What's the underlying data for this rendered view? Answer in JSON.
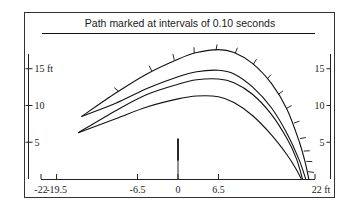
{
  "chart_data": {
    "type": "line",
    "title": "Path marked at intervals of 0.10 seconds",
    "xlabel": "",
    "ylabel": "",
    "x_unit": "ft",
    "y_unit": "ft",
    "xlim": [
      -22,
      22
    ],
    "ylim": [
      0,
      19
    ],
    "x_ticks": [
      -22,
      -19.5,
      -6.5,
      0,
      6.5,
      22
    ],
    "x_tick_labels": [
      "-22",
      "-19.5",
      "-6.5",
      "0",
      "6.5",
      "22 ft"
    ],
    "y_ticks": [
      5,
      10,
      15
    ],
    "y_tick_labels_left": [
      "5",
      "10",
      "15 ft"
    ],
    "y_tick_labels_right": [
      "5",
      "10",
      "15"
    ],
    "grid": false,
    "legend": null,
    "annotations": [
      {
        "type": "vertical-marker",
        "x": 0,
        "y_from": 0,
        "y_to": 5.5,
        "thick_from": 2.5
      }
    ],
    "series": [
      {
        "name": "path-1 (marked every 0.10 s)",
        "points": [
          [
            -15.5,
            8.5
          ],
          [
            -10,
            11.7
          ],
          [
            -5,
            14.3
          ],
          [
            0,
            16.3
          ],
          [
            3,
            17.2
          ],
          [
            6.5,
            17.6
          ],
          [
            9,
            17.2
          ],
          [
            12,
            15.7
          ],
          [
            15,
            13
          ],
          [
            17.5,
            9.5
          ],
          [
            19.5,
            5
          ],
          [
            20.5,
            2
          ],
          [
            21,
            0
          ]
        ],
        "time_marks": [
          [
            -9.5,
            11.9
          ],
          [
            -4.2,
            14.7
          ],
          [
            -0.6,
            16.2
          ],
          [
            2.6,
            17.1
          ],
          [
            6.1,
            17.5
          ],
          [
            9.2,
            17.1
          ],
          [
            12.1,
            15.6
          ],
          [
            14.3,
            13.6
          ],
          [
            16.1,
            11.5
          ],
          [
            17.4,
            9.6
          ],
          [
            18.6,
            7.6
          ],
          [
            19.6,
            5.5
          ],
          [
            20.2,
            3.8
          ],
          [
            20.6,
            2.4
          ],
          [
            20.9,
            1
          ]
        ]
      },
      {
        "name": "path-2",
        "points": [
          [
            -15.5,
            8.5
          ],
          [
            -10,
            10.3
          ],
          [
            -5,
            12.3
          ],
          [
            0,
            13.9
          ],
          [
            3,
            14.6
          ],
          [
            6.5,
            14.8
          ],
          [
            9,
            14.3
          ],
          [
            12,
            12.5
          ],
          [
            15,
            9.7
          ],
          [
            17.5,
            6.2
          ],
          [
            19.5,
            2.5
          ],
          [
            20.5,
            0
          ]
        ]
      },
      {
        "name": "path-3",
        "points": [
          [
            -16,
            6.3
          ],
          [
            -10,
            9.3
          ],
          [
            -5,
            11.5
          ],
          [
            0,
            12.9
          ],
          [
            3,
            13.5
          ],
          [
            6.5,
            13.6
          ],
          [
            9,
            13.1
          ],
          [
            12,
            11.5
          ],
          [
            15,
            8.8
          ],
          [
            17.5,
            5.5
          ],
          [
            19,
            2.8
          ],
          [
            20,
            0
          ]
        ]
      },
      {
        "name": "path-4",
        "points": [
          [
            -16,
            6.3
          ],
          [
            -10,
            8.2
          ],
          [
            -5,
            9.8
          ],
          [
            0,
            10.9
          ],
          [
            3,
            11.3
          ],
          [
            6.5,
            11.2
          ],
          [
            9,
            10.4
          ],
          [
            12,
            8.6
          ],
          [
            15,
            6
          ],
          [
            17.5,
            3.3
          ],
          [
            19,
            1.3
          ],
          [
            19.8,
            0
          ]
        ]
      }
    ]
  }
}
